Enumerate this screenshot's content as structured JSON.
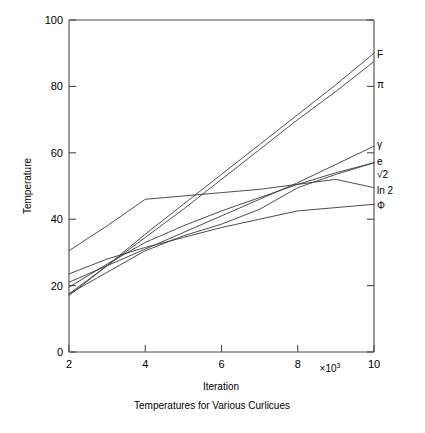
{
  "chart_data": {
    "type": "line",
    "title": "",
    "caption": "Temperatures for Various Curlicues",
    "xlabel": "Iteration",
    "ylabel": "Temperature",
    "x_multiplier": "×10",
    "x_multiplier_exponent": "3",
    "xlim": [
      2,
      10
    ],
    "ylim": [
      0,
      100
    ],
    "xticks": [
      2,
      4,
      6,
      8,
      10
    ],
    "xtick_labels": [
      "2",
      "4",
      "6",
      "8",
      "10"
    ],
    "yticks": [
      0,
      20,
      40,
      60,
      80,
      100
    ],
    "ytick_labels": [
      "0",
      "20",
      "40",
      "60",
      "80",
      "100"
    ],
    "grid": false,
    "legend_position": "right-inline-labels",
    "x": [
      2,
      3,
      4,
      5,
      6,
      7,
      8,
      9,
      10
    ],
    "series": [
      {
        "name": "F",
        "label": "F",
        "label_y": 89.5,
        "values": [
          17.0,
          26.0,
          35.5,
          44.5,
          53.5,
          62.5,
          71.5,
          80.5,
          90.0
        ]
      },
      {
        "name": "pi",
        "label": "π",
        "label_y": 80.5,
        "values": [
          17.5,
          26.0,
          34.5,
          43.0,
          52.0,
          61.0,
          70.0,
          78.5,
          87.5
        ]
      },
      {
        "name": "gamma",
        "label": "γ",
        "label_y": 62.5,
        "values": [
          21.0,
          26.0,
          31.0,
          36.0,
          41.0,
          46.0,
          51.0,
          56.5,
          62.0
        ]
      },
      {
        "name": "e",
        "label": "e",
        "label_y": 57.5,
        "values": [
          19.5,
          26.5,
          33.0,
          38.0,
          42.5,
          46.5,
          50.5,
          54.0,
          57.0
        ]
      },
      {
        "name": "sqrt2",
        "label": "√2",
        "label_y": 53.5,
        "values": [
          17.5,
          24.0,
          30.5,
          35.0,
          38.5,
          43.0,
          49.5,
          53.5,
          57.0
        ]
      },
      {
        "name": "ln2",
        "label": "ln 2",
        "label_y": 48.5,
        "values": [
          30.5,
          38.0,
          46.0,
          47.0,
          48.0,
          49.0,
          50.5,
          52.0,
          49.5
        ]
      },
      {
        "name": "phi",
        "label": "Φ",
        "label_y": 44.0,
        "values": [
          23.5,
          28.0,
          31.5,
          34.5,
          37.5,
          40.0,
          42.5,
          43.5,
          44.5
        ]
      }
    ]
  }
}
